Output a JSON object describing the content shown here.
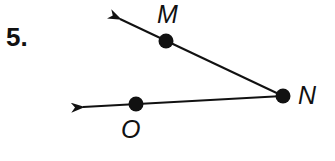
{
  "problem": {
    "number": "5."
  },
  "diagram": {
    "type": "angle",
    "vertex": {
      "label": "N",
      "x": 283,
      "y": 96
    },
    "points": [
      {
        "label": "M",
        "x": 166,
        "y": 41,
        "label_x": 156,
        "label_y": 0
      },
      {
        "label": "O",
        "x": 136,
        "y": 104,
        "label_x": 120,
        "label_y": 115
      }
    ],
    "rays": [
      {
        "from": "N",
        "through": "M",
        "arrow_x": 117,
        "arrow_y": 18
      },
      {
        "from": "N",
        "through": "O",
        "arrow_x": 80,
        "arrow_y": 107
      }
    ],
    "stroke_color": "#111111"
  }
}
